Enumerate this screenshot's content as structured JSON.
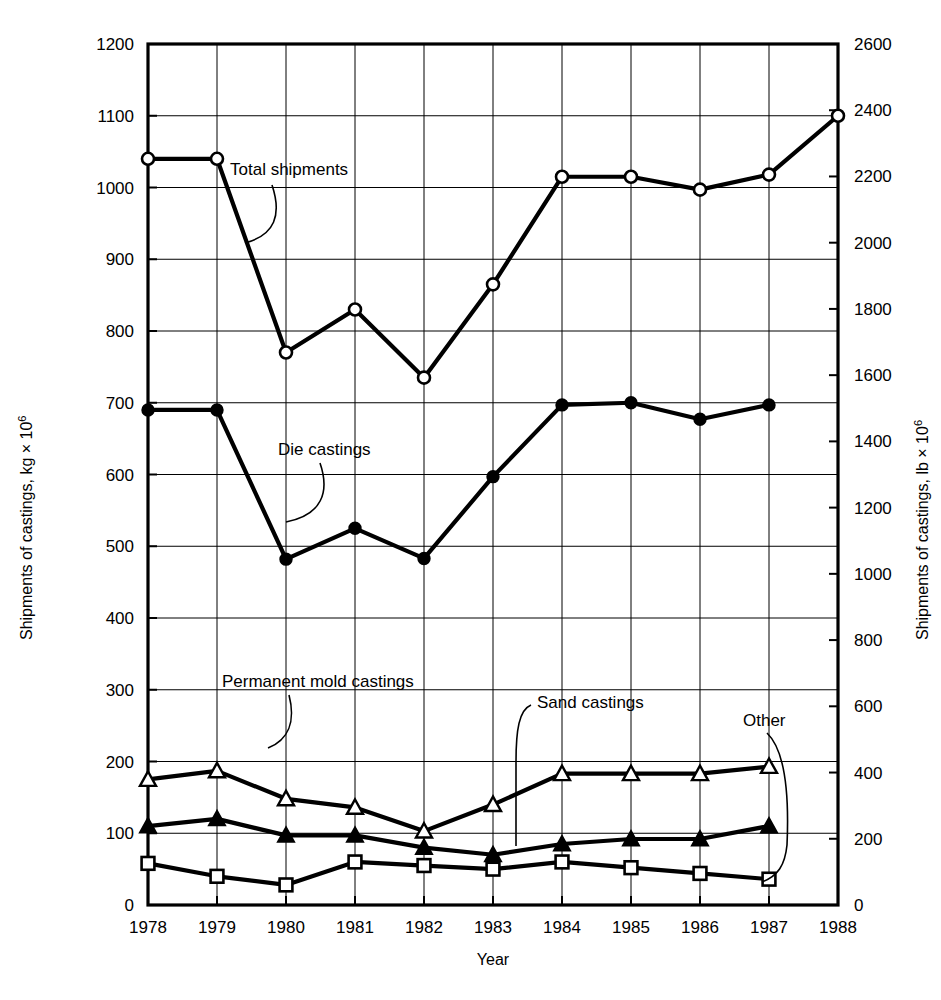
{
  "chart_data": {
    "type": "line",
    "title": "",
    "xlabel": "Year",
    "ylabel": "Shipments of castings, kg × 10⁶",
    "ylabel_right": "Shipments of castings, lb × 10⁶",
    "x": [
      1978,
      1979,
      1980,
      1981,
      1982,
      1983,
      1984,
      1985,
      1986,
      1987,
      1988
    ],
    "xticklabels": [
      "1978",
      "1979",
      "1980",
      "1981",
      "1982",
      "1983",
      "1984",
      "1985",
      "1986",
      "1987",
      "1988"
    ],
    "xlim": [
      1978,
      1988
    ],
    "ylim": [
      0,
      1200
    ],
    "yticks": [
      0,
      100,
      200,
      300,
      400,
      500,
      600,
      700,
      800,
      900,
      1000,
      1100,
      1200
    ],
    "yticklabels": [
      "0",
      "100",
      "200",
      "300",
      "400",
      "500",
      "600",
      "700",
      "800",
      "900",
      "1000",
      "1100",
      "1200"
    ],
    "ylim_right": [
      0,
      2600
    ],
    "yticks_right": [
      0,
      200,
      400,
      600,
      800,
      1000,
      1200,
      1400,
      1600,
      1800,
      2000,
      2200,
      2400,
      2600
    ],
    "yticklabels_right": [
      "0",
      "200",
      "400",
      "600",
      "800",
      "1000",
      "1200",
      "1400",
      "1600",
      "1800",
      "2000",
      "2200",
      "2400",
      "2600"
    ],
    "grid": true,
    "legend_position": "inline-annotations",
    "series": [
      {
        "name": "Total shipments",
        "marker": "open-circle",
        "x": [
          1978,
          1979,
          1980,
          1981,
          1982,
          1983,
          1984,
          1985,
          1986,
          1987,
          1988
        ],
        "values": [
          1040,
          1040,
          770,
          830,
          735,
          865,
          1015,
          1015,
          997,
          1018,
          1100
        ]
      },
      {
        "name": "Die castings",
        "marker": "filled-circle",
        "x": [
          1978,
          1979,
          1980,
          1981,
          1982,
          1983,
          1984,
          1985,
          1986,
          1987
        ],
        "values": [
          690,
          690,
          482,
          525,
          483,
          597,
          697,
          700,
          677,
          697
        ]
      },
      {
        "name": "Sand castings",
        "marker": "open-triangle",
        "x": [
          1978,
          1979,
          1980,
          1981,
          1982,
          1983,
          1984,
          1985,
          1986,
          1987
        ],
        "values": [
          175,
          187,
          148,
          136,
          103,
          140,
          183,
          183,
          183,
          193
        ]
      },
      {
        "name": "Permanent mold castings",
        "marker": "filled-triangle",
        "x": [
          1978,
          1979,
          1980,
          1981,
          1982,
          1983,
          1984,
          1985,
          1986,
          1987
        ],
        "values": [
          110,
          120,
          97,
          97,
          80,
          70,
          85,
          92,
          92,
          110
        ]
      },
      {
        "name": "Other",
        "marker": "open-square",
        "x": [
          1978,
          1979,
          1980,
          1981,
          1982,
          1983,
          1984,
          1985,
          1986,
          1987
        ],
        "values": [
          58,
          40,
          28,
          60,
          55,
          50,
          60,
          52,
          44,
          36
        ]
      }
    ],
    "annotations": [
      {
        "text": "Total shipments",
        "x": 230,
        "y": 175
      },
      {
        "text": "Die castings",
        "x": 278,
        "y": 455
      },
      {
        "text": "Permanent mold castings",
        "x": 222,
        "y": 687
      },
      {
        "text": "Sand castings",
        "x": 537,
        "y": 708
      },
      {
        "text": "Other",
        "x": 743,
        "y": 726
      }
    ]
  },
  "axes": {
    "left_title": "Shipments of castings, kg × 10⁶",
    "right_title": "Shipments of castings, lb × 10⁶",
    "left_title_main": "Shipments of castings, kg × 10",
    "right_title_main": "Shipments of castings, lb × 10",
    "exponent": "6",
    "x_title": "Year"
  }
}
